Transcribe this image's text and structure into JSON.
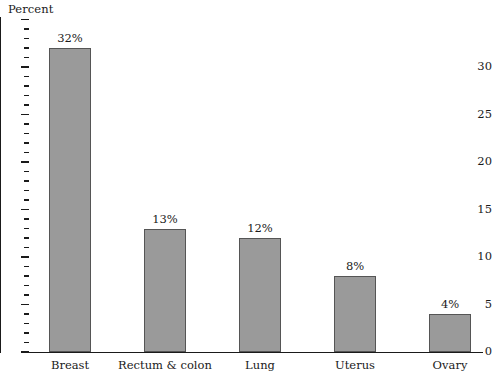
{
  "chart_data": {
    "type": "bar",
    "title": "",
    "subtitle": "",
    "xlabel": "",
    "ylabel": "Percent",
    "ylim": [
      0,
      34
    ],
    "ytick_step": 5,
    "yminor_step": 1,
    "ytick_labels": [
      "0",
      "5",
      "10",
      "15",
      "20",
      "25",
      "30"
    ],
    "ytick_values": [
      0,
      5,
      10,
      15,
      20,
      25,
      30
    ],
    "grid": false,
    "legend": null,
    "value_label_suffix": "%",
    "categories": [
      "Breast",
      "Rectum & colon",
      "Lung",
      "Uterus",
      "Ovary"
    ],
    "values": [
      32,
      13,
      12,
      8,
      4
    ],
    "value_labels": [
      "32%",
      "13%",
      "12%",
      "8%",
      "4%"
    ],
    "bar_color": "#9a9a9a",
    "bar_edge_color": "#555555",
    "axis_color": "#1a1a1a",
    "background_color": "#ffffff"
  }
}
